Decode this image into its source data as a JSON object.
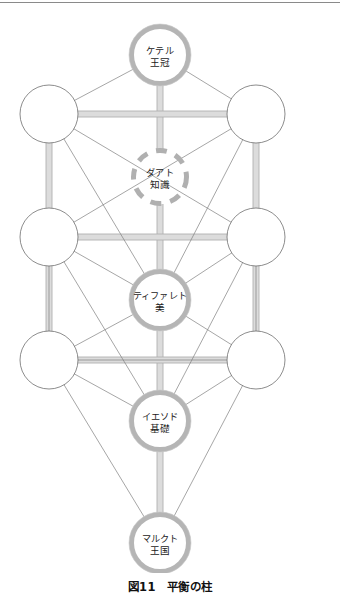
{
  "figure": {
    "caption": "図11　平衡の柱",
    "caption_number": "図11",
    "caption_title": "平衡の柱"
  },
  "colors": {
    "background": "#ffffff",
    "thin_edge": "#808080",
    "pillar_edge": "#b0b0b0",
    "highlight_ring": "#b5b5b5",
    "plain_ring": "#6e6e6e",
    "dashed_ring": "#b0b0b0",
    "text": "#1a1a1a",
    "rule": "#8a8a8a"
  },
  "diagram": {
    "type": "tree-of-life",
    "width": 340,
    "height": 565,
    "nodes": [
      {
        "id": "keter",
        "cx": 160,
        "cy": 47,
        "r": 31,
        "style": "highlight",
        "line1": "ケテル",
        "line2": "王冠"
      },
      {
        "id": "chokmah",
        "cx": 49,
        "cy": 106,
        "r": 29,
        "style": "plain",
        "line1": "",
        "line2": ""
      },
      {
        "id": "binah",
        "cx": 256,
        "cy": 106,
        "r": 29,
        "style": "plain",
        "line1": "",
        "line2": ""
      },
      {
        "id": "daath",
        "cx": 160,
        "cy": 169,
        "r": 29,
        "style": "dashed",
        "line1": "ダアト",
        "line2": "知識"
      },
      {
        "id": "chesed",
        "cx": 49,
        "cy": 229,
        "r": 29,
        "style": "plain",
        "line1": "",
        "line2": ""
      },
      {
        "id": "geburah",
        "cx": 256,
        "cy": 229,
        "r": 29,
        "style": "plain",
        "line1": "",
        "line2": ""
      },
      {
        "id": "tiphareth",
        "cx": 160,
        "cy": 292,
        "r": 31,
        "style": "highlight",
        "line1": "ティファレト",
        "line2": "美"
      },
      {
        "id": "netzach",
        "cx": 49,
        "cy": 352,
        "r": 29,
        "style": "plain",
        "line1": "",
        "line2": ""
      },
      {
        "id": "hod",
        "cx": 256,
        "cy": 352,
        "r": 29,
        "style": "plain",
        "line1": "",
        "line2": ""
      },
      {
        "id": "yesod",
        "cx": 160,
        "cy": 413,
        "r": 31,
        "style": "highlight",
        "line1": "イエソド",
        "line2": "基礎"
      },
      {
        "id": "malkuth",
        "cx": 160,
        "cy": 535,
        "r": 31,
        "style": "highlight",
        "line1": "マルクト",
        "line2": "王国"
      }
    ],
    "pillar_edges": [
      {
        "from": "keter",
        "to": "daath"
      },
      {
        "from": "daath",
        "to": "tiphareth"
      },
      {
        "from": "tiphareth",
        "to": "yesod"
      },
      {
        "from": "yesod",
        "to": "malkuth"
      },
      {
        "from": "chokmah",
        "to": "binah"
      },
      {
        "from": "chesed",
        "to": "geburah"
      },
      {
        "from": "netzach",
        "to": "hod"
      },
      {
        "from": "chokmah",
        "to": "chesed"
      },
      {
        "from": "chesed",
        "to": "netzach"
      },
      {
        "from": "binah",
        "to": "geburah"
      },
      {
        "from": "geburah",
        "to": "hod"
      }
    ],
    "thin_edges": [
      {
        "from": "keter",
        "to": "chokmah"
      },
      {
        "from": "keter",
        "to": "binah"
      },
      {
        "from": "chokmah",
        "to": "tiphareth"
      },
      {
        "from": "binah",
        "to": "tiphareth"
      },
      {
        "from": "chokmah",
        "to": "geburah"
      },
      {
        "from": "binah",
        "to": "chesed"
      },
      {
        "from": "chesed",
        "to": "tiphareth"
      },
      {
        "from": "geburah",
        "to": "tiphareth"
      },
      {
        "from": "chesed",
        "to": "netzach"
      },
      {
        "from": "geburah",
        "to": "hod"
      },
      {
        "from": "netzach",
        "to": "tiphareth"
      },
      {
        "from": "hod",
        "to": "tiphareth"
      },
      {
        "from": "netzach",
        "to": "yesod"
      },
      {
        "from": "hod",
        "to": "yesod"
      },
      {
        "from": "netzach",
        "to": "hod"
      },
      {
        "from": "netzach",
        "to": "malkuth"
      },
      {
        "from": "hod",
        "to": "malkuth"
      },
      {
        "from": "chesed",
        "to": "yesod"
      },
      {
        "from": "geburah",
        "to": "yesod"
      }
    ]
  }
}
